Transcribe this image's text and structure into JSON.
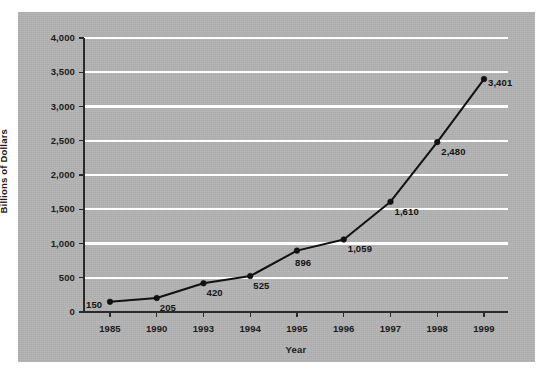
{
  "chart_data": {
    "type": "line",
    "title": "",
    "xlabel": "Year",
    "ylabel": "Billions of Dollars",
    "categories": [
      "1985",
      "1990",
      "1993",
      "1994",
      "1995",
      "1996",
      "1997",
      "1998",
      "1999"
    ],
    "values": [
      150,
      205,
      420,
      525,
      896,
      1059,
      1610,
      2480,
      3401
    ],
    "point_labels": [
      "150",
      "205",
      "420",
      "525",
      "896",
      "1,059",
      "1,610",
      "2,480",
      "3,401"
    ],
    "ylim": [
      0,
      4000
    ],
    "yticks": [
      0,
      500,
      1000,
      1500,
      2000,
      2500,
      3000,
      3500,
      4000
    ],
    "ytick_labels": [
      "0",
      "500",
      "1,000",
      "1,500",
      "2,000",
      "2,500",
      "3,000",
      "3,500",
      "4,000"
    ],
    "grid": true,
    "grid_color": "#ffffff",
    "legend": "none",
    "series_color": "#111111",
    "marker": "circle",
    "panel_color": "#b2b2b2",
    "page_color": "#ffffff"
  }
}
